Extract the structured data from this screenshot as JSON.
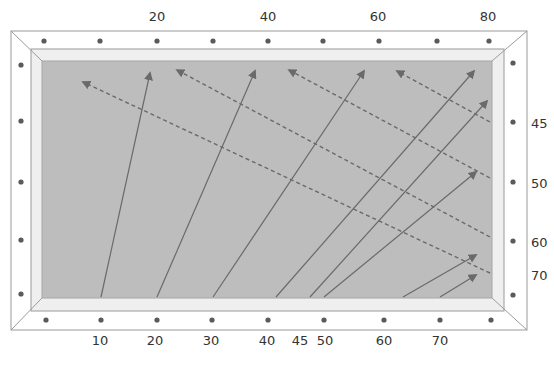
{
  "colors": {
    "frame_fill": "#ffffff",
    "frame_stroke": "#9a9a9a",
    "inner_frame_fill": "#efefef",
    "field_fill": "#bdbdbd",
    "dot": "#5a5a5a",
    "arrow": "#6a6a6a"
  },
  "top_labels": [
    {
      "text": "20",
      "x": 157
    },
    {
      "text": "40",
      "x": 268
    },
    {
      "text": "60",
      "x": 378
    },
    {
      "text": "80",
      "x": 488
    }
  ],
  "bottom_labels": [
    {
      "text": "10",
      "x": 100
    },
    {
      "text": "20",
      "x": 155
    },
    {
      "text": "30",
      "x": 211
    },
    {
      "text": "40",
      "x": 267
    },
    {
      "text": "45",
      "x": 300
    },
    {
      "text": "50",
      "x": 325
    },
    {
      "text": "60",
      "x": 384
    },
    {
      "text": "70",
      "x": 440
    }
  ],
  "right_labels": [
    {
      "text": "45",
      "y": 123
    },
    {
      "text": "50",
      "y": 183
    },
    {
      "text": "60",
      "y": 242
    },
    {
      "text": "70",
      "y": 275
    }
  ],
  "dots": {
    "top": [
      44,
      100,
      157,
      213,
      268,
      323,
      379,
      437,
      489
    ],
    "bottom": [
      46,
      101,
      157,
      212,
      268,
      324,
      384,
      440,
      491
    ],
    "left": [
      65,
      121,
      182,
      240,
      294
    ],
    "right": [
      63,
      122,
      182,
      241,
      295
    ]
  },
  "solid_arrows": [
    {
      "label": "10",
      "x1": 101,
      "y1": 297,
      "x2": 150,
      "y2": 73
    },
    {
      "label": "20",
      "x1": 157,
      "y1": 297,
      "x2": 255,
      "y2": 71
    },
    {
      "label": "30",
      "x1": 213,
      "y1": 297,
      "x2": 364,
      "y2": 71
    },
    {
      "label": "40",
      "x1": 276,
      "y1": 297,
      "x2": 474,
      "y2": 71
    },
    {
      "label": "45",
      "x1": 310,
      "y1": 297,
      "x2": 487,
      "y2": 101
    },
    {
      "label": "50",
      "x1": 324,
      "y1": 297,
      "x2": 476,
      "y2": 172
    },
    {
      "label": "60",
      "x1": 403,
      "y1": 297,
      "x2": 476,
      "y2": 255
    },
    {
      "label": "70",
      "x1": 440,
      "y1": 297,
      "x2": 476,
      "y2": 275
    }
  ],
  "dashed_arrows": [
    {
      "x1": 490,
      "y1": 122,
      "x2": 397,
      "y2": 71
    },
    {
      "x1": 490,
      "y1": 178,
      "x2": 289,
      "y2": 70
    },
    {
      "x1": 490,
      "y1": 237,
      "x2": 177,
      "y2": 70
    },
    {
      "x1": 490,
      "y1": 273,
      "x2": 83,
      "y2": 82
    }
  ]
}
